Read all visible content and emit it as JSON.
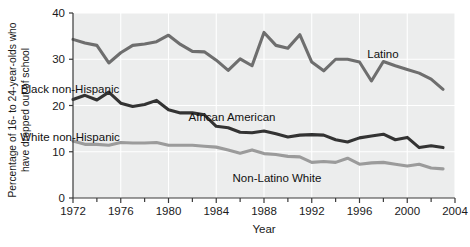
{
  "chart_data": {
    "type": "line",
    "title": "",
    "xlabel": "Year",
    "ylabel": "Percentage of 16- to 24-year-olds who have dropped out of school",
    "ylabel_line1": "Percentage of 16- to 24-year-olds who",
    "ylabel_line2": "have dropped out of school",
    "xlim": [
      1972,
      2004
    ],
    "ylim": [
      0,
      40
    ],
    "xticks": [
      1972,
      1976,
      1980,
      1984,
      1988,
      1992,
      1996,
      2000,
      2004
    ],
    "xticklabels": [
      "1972",
      "1976",
      "1980",
      "1984",
      "1988",
      "1992",
      "1996",
      "2000",
      "2004"
    ],
    "xminorticks": [
      1974,
      1978,
      1982,
      1986,
      1990,
      1994,
      1998,
      2002
    ],
    "yticks": [
      0,
      10,
      20,
      30,
      40
    ],
    "yticklabels": [
      "0",
      "10",
      "20",
      "30",
      "40"
    ],
    "grid": "vertical-and-horizontal-white-on-gray",
    "legend_position": "inline-annotations",
    "x": [
      1972,
      1973,
      1974,
      1975,
      1976,
      1977,
      1978,
      1979,
      1980,
      1981,
      1982,
      1983,
      1984,
      1985,
      1986,
      1987,
      1988,
      1989,
      1990,
      1991,
      1992,
      1993,
      1994,
      1995,
      1996,
      1997,
      1998,
      1999,
      2000,
      2001,
      2002,
      2003
    ],
    "series": [
      {
        "name": "Latino",
        "label": "Latino",
        "color": "#6e6e6e",
        "values": [
          34.3,
          33.5,
          33.0,
          29.2,
          31.4,
          33.0,
          33.3,
          33.8,
          35.2,
          33.2,
          31.7,
          31.6,
          29.8,
          27.6,
          30.1,
          28.6,
          35.8,
          33.0,
          32.4,
          35.3,
          29.4,
          27.5,
          30.0,
          30.0,
          29.4,
          25.3,
          29.5,
          28.6,
          27.8,
          27.0,
          25.7,
          23.5
        ]
      },
      {
        "name": "African American",
        "label": "African American",
        "color": "#333333",
        "values": [
          21.3,
          22.2,
          21.2,
          22.9,
          20.5,
          19.8,
          20.2,
          21.1,
          19.1,
          18.4,
          18.4,
          18.0,
          15.5,
          15.2,
          14.2,
          14.1,
          14.5,
          13.9,
          13.2,
          13.6,
          13.7,
          13.6,
          12.6,
          12.1,
          13.0,
          13.4,
          13.8,
          12.6,
          13.1,
          10.9,
          11.3,
          10.9
        ]
      },
      {
        "name": "Non-Latino White",
        "label": "Non-Latino White",
        "color": "#9b9b9b",
        "values": [
          12.3,
          11.6,
          11.6,
          11.4,
          12.0,
          11.9,
          11.9,
          12.0,
          11.4,
          11.4,
          11.4,
          11.2,
          11.0,
          10.4,
          9.7,
          10.4,
          9.6,
          9.4,
          9.0,
          8.9,
          7.7,
          7.9,
          7.7,
          8.6,
          7.3,
          7.6,
          7.7,
          7.3,
          6.9,
          7.3,
          6.5,
          6.3
        ]
      }
    ],
    "annotations": [
      {
        "text": "Latino",
        "x": 383,
        "y": 58,
        "series": "latino"
      },
      {
        "text": "Black non-Hispanic",
        "x": 70,
        "y": 93,
        "series": "african-american"
      },
      {
        "text": "African American",
        "x": 232,
        "y": 121,
        "series": "african-american"
      },
      {
        "text": "White non-Hispanic",
        "x": 70,
        "y": 141,
        "series": "non-latino-white"
      },
      {
        "text": "Non-Latino White",
        "x": 277,
        "y": 182,
        "series": "non-latino-white"
      }
    ]
  },
  "colors": {
    "plot_background": "#eceded",
    "page_background": "#ffffff",
    "gridline": "#ffffff",
    "axis": "#3a3a3a",
    "latino": "#6e6e6e",
    "african_american": "#333333",
    "non_latino_white": "#9b9b9b",
    "text": "#1a1a1a"
  }
}
